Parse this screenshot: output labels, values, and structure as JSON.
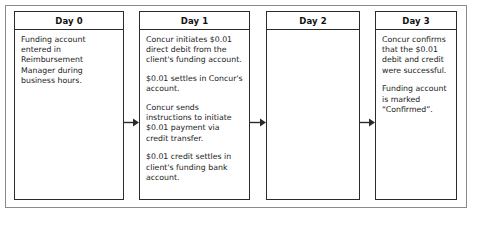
{
  "diagram": {
    "frame_border_color": "#8a8a8a",
    "box_border_color": "#2b2b2b",
    "background_color": "#ffffff",
    "columns": [
      {
        "id": "day-0",
        "header": "Day 0",
        "paragraphs": [
          "Funding account entered in Reimbursement Manager during business hours."
        ]
      },
      {
        "id": "day-1",
        "header": "Day 1",
        "paragraphs": [
          "Concur initiates $0.01 direct debit from the client's funding account.",
          "$0.01 settles in Concur's account.",
          "Concur sends instructions to initiate $0.01 payment via credit transfer.",
          "$0.01 credit settles in client's funding bank account."
        ]
      },
      {
        "id": "day-2",
        "header": "Day 2",
        "paragraphs": []
      },
      {
        "id": "day-3",
        "header": "Day 3",
        "paragraphs": [
          "Concur confirms that the $0.01 debit and credit were successful.",
          "Funding account is marked “Confirmed”."
        ]
      }
    ],
    "connectors": [
      {
        "id": "arrow-0-1",
        "icon": "right-arrow-icon",
        "from": "day-0",
        "to": "day-1"
      },
      {
        "id": "arrow-1-2",
        "icon": "right-arrow-icon",
        "from": "day-1",
        "to": "day-2"
      },
      {
        "id": "arrow-2-3",
        "icon": "right-arrow-icon",
        "from": "day-2",
        "to": "day-3"
      }
    ]
  }
}
